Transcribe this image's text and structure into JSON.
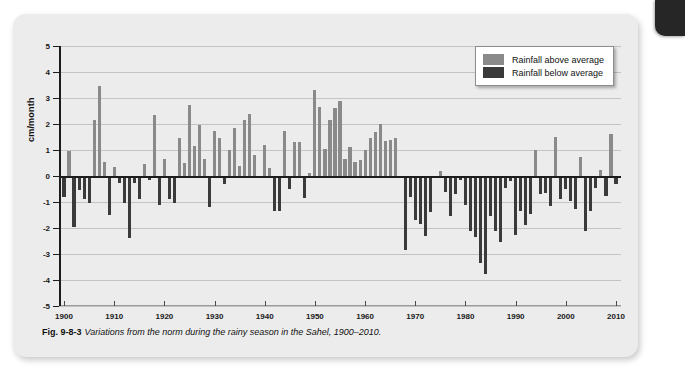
{
  "figure": {
    "caption_label": "Fig. 9-8-3",
    "caption_text": "Variations from the norm during the rainy season in the Sahel, 1900–2010."
  },
  "legend": {
    "position": "top-right",
    "items": [
      {
        "label": "Rainfall above average",
        "color": "#8a8a8a"
      },
      {
        "label": "Rainfall below average",
        "color": "#3a3a3a"
      }
    ]
  },
  "colors": {
    "above_average": "#8a8a8a",
    "below_average": "#3a3a3a",
    "panel_background": "#ececec",
    "gridline": "#c3c3c3",
    "axis": "#1c1c1c",
    "page_tab": "#262626"
  },
  "chart_data": {
    "type": "bar",
    "title": "",
    "subtitle": "",
    "xlabel": "",
    "ylabel": "cm/month",
    "xlim": [
      1899,
      2011
    ],
    "ylim": [
      -5,
      5
    ],
    "grid": true,
    "y_ticks": [
      5,
      4,
      3,
      2,
      1,
      0,
      -1,
      -2,
      -3,
      -4,
      -5
    ],
    "y_tick_labels": [
      "5",
      "4",
      "3",
      "2",
      "1",
      "0",
      "-1",
      "-2",
      "-3",
      "-4",
      "-5"
    ],
    "x_ticks": [
      1900,
      1910,
      1920,
      1930,
      1940,
      1950,
      1960,
      1970,
      1980,
      1990,
      2000,
      2010
    ],
    "x_tick_labels": [
      "1900",
      "1910",
      "1920",
      "1930",
      "1940",
      "1950",
      "1960",
      "1970",
      "1980",
      "1990",
      "2000",
      "2010"
    ],
    "series": [
      {
        "name": "Rainfall anomaly",
        "x": [
          1900,
          1901,
          1902,
          1903,
          1904,
          1905,
          1906,
          1907,
          1908,
          1909,
          1910,
          1911,
          1912,
          1913,
          1914,
          1915,
          1916,
          1917,
          1918,
          1919,
          1920,
          1921,
          1922,
          1923,
          1924,
          1925,
          1926,
          1927,
          1928,
          1929,
          1930,
          1931,
          1932,
          1933,
          1934,
          1935,
          1936,
          1937,
          1938,
          1939,
          1940,
          1941,
          1942,
          1943,
          1944,
          1945,
          1946,
          1947,
          1948,
          1949,
          1950,
          1951,
          1952,
          1953,
          1954,
          1955,
          1956,
          1957,
          1958,
          1959,
          1960,
          1961,
          1962,
          1963,
          1964,
          1965,
          1966,
          1967,
          1968,
          1969,
          1970,
          1971,
          1972,
          1973,
          1974,
          1975,
          1976,
          1977,
          1978,
          1979,
          1980,
          1981,
          1982,
          1983,
          1984,
          1985,
          1986,
          1987,
          1988,
          1989,
          1990,
          1991,
          1992,
          1993,
          1994,
          1995,
          1996,
          1997,
          1998,
          1999,
          2000,
          2001,
          2002,
          2003,
          2004,
          2005,
          2006,
          2007,
          2008,
          2009,
          2010
        ],
        "values": [
          -0.8,
          0.95,
          -1.95,
          -0.55,
          -0.9,
          -1.05,
          2.15,
          3.45,
          0.55,
          -1.5,
          0.35,
          -0.25,
          -1.05,
          -2.4,
          -0.25,
          -0.9,
          0.45,
          -0.15,
          2.35,
          -1.1,
          0.65,
          -0.9,
          -1.05,
          1.45,
          0.5,
          2.75,
          1.15,
          1.95,
          0.65,
          -1.2,
          1.75,
          1.45,
          -0.3,
          1.0,
          1.85,
          0.4,
          2.15,
          2.4,
          0.8,
          -0.05,
          1.2,
          0.3,
          -1.35,
          -1.35,
          1.75,
          -0.5,
          1.3,
          1.3,
          -0.85,
          0.1,
          3.3,
          2.65,
          1.05,
          2.15,
          2.6,
          2.9,
          0.65,
          1.1,
          0.55,
          0.6,
          1.0,
          1.45,
          1.7,
          2.0,
          1.35,
          1.4,
          1.45,
          -0.05,
          -2.85,
          -0.8,
          -1.7,
          -1.85,
          -2.3,
          -1.4,
          -0.05,
          0.2,
          -0.6,
          -1.55,
          -0.7,
          -0.15,
          -1.1,
          -2.1,
          -2.35,
          -3.35,
          -3.75,
          -1.55,
          -2.1,
          -2.55,
          -0.45,
          -0.2,
          -2.25,
          -1.35,
          -1.9,
          -1.45,
          1.0,
          -0.7,
          -0.65,
          -1.15,
          1.5,
          -0.9,
          -0.5,
          -0.95,
          -1.25,
          0.75,
          -2.1,
          -1.35,
          -0.45,
          0.25,
          -0.75,
          1.6,
          -0.3
        ]
      }
    ]
  }
}
